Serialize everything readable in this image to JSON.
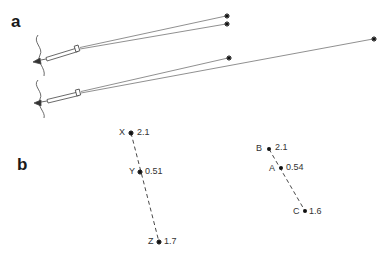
{
  "panels": {
    "a": {
      "label": "a"
    },
    "b": {
      "label": "b"
    }
  },
  "panel_b": {
    "left_group": {
      "points": [
        {
          "name": "X",
          "value": "2.1"
        },
        {
          "name": "Y",
          "value": "0.51"
        },
        {
          "name": "Z",
          "value": "1.7"
        }
      ]
    },
    "right_group": {
      "points": [
        {
          "name": "B",
          "value": "2.1"
        },
        {
          "name": "A",
          "value": "0.54"
        },
        {
          "name": "C",
          "value": "1.6"
        }
      ]
    }
  },
  "colors": {
    "line": "#555555",
    "ink": "#1a1a1a"
  }
}
